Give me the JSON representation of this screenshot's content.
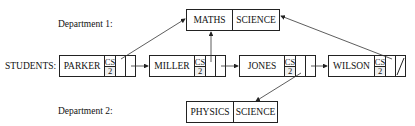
{
  "labels": {
    "department1": "Department 1:",
    "students": "STUDENTS:",
    "department2": "Department 2:"
  },
  "departments": [
    {
      "name": "MATHS",
      "faculty": "SCIENCE"
    },
    {
      "name": "PHYSICS",
      "faculty": "SCIENCE"
    }
  ],
  "students": [
    {
      "name": "PARKER",
      "course": "CS",
      "year": "2",
      "dept": "MATHS"
    },
    {
      "name": "MILLER",
      "course": "CS",
      "year": "2",
      "dept": "MATHS"
    },
    {
      "name": "JONES",
      "course": "CS",
      "year": "2",
      "dept": "PHYSICS"
    },
    {
      "name": "WILSON",
      "course": "CS",
      "year": "2",
      "dept": "MATHS"
    }
  ]
}
